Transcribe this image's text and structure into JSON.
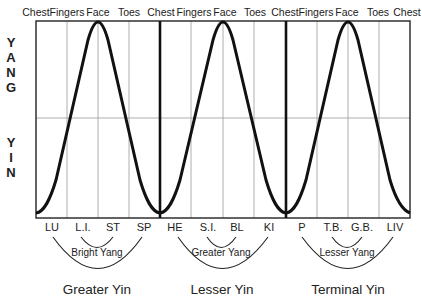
{
  "diagram": {
    "axis_labels": {
      "upper": [
        "Y",
        "A",
        "N",
        "G"
      ],
      "lower": [
        "Y",
        "I",
        "N"
      ]
    },
    "top_labels": [
      "Chest",
      "Fingers",
      "Face",
      "Toes",
      "Chest",
      "Fingers",
      "Face",
      "Toes",
      "Chest",
      "Fingers",
      "Face",
      "Toes",
      "Chest"
    ],
    "bottom_labels": [
      "LU",
      "L.I.",
      "ST",
      "SP",
      "HE",
      "S.I.",
      "BL",
      "KI",
      "P",
      "T.B.",
      "G.B.",
      "LIV"
    ],
    "groups": [
      {
        "inner_pair": [
          "L.I.",
          "ST"
        ],
        "inner_label": "Bright Yang",
        "outer_pair": [
          "LU",
          "SP"
        ],
        "outer_label": "Greater Yin"
      },
      {
        "inner_pair": [
          "S.I.",
          "BL"
        ],
        "inner_label": "Greater Yang",
        "outer_pair": [
          "HE",
          "KI"
        ],
        "outer_label": "Lesser Yin"
      },
      {
        "inner_pair": [
          "T.B.",
          "G.B."
        ],
        "inner_label": "Lesser Yang",
        "outer_pair": [
          "P",
          "LIV"
        ],
        "outer_label": "Terminal Yin"
      }
    ],
    "colors": {
      "line": "#111111",
      "grid": "#999999",
      "text": "#222222"
    }
  }
}
